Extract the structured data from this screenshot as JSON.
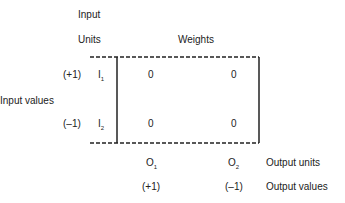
{
  "header": {
    "input_label_line1": "Input",
    "input_label_line2": "Units",
    "weights_label": "Weights"
  },
  "side_label": "Input values",
  "inputs": [
    {
      "value": "(+1)",
      "unit": "I",
      "sub": "1",
      "weights": [
        "0",
        "0"
      ]
    },
    {
      "value": "(–1)",
      "unit": "I",
      "sub": "2",
      "weights": [
        "0",
        "0"
      ]
    }
  ],
  "outputs": [
    {
      "unit": "O",
      "sub": "1",
      "value": "(+1)"
    },
    {
      "unit": "O",
      "sub": "2",
      "value": "(–1)"
    }
  ],
  "output_units_label": "Output units",
  "output_values_label": "Output values"
}
